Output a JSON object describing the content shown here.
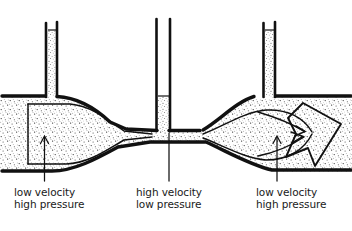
{
  "figure": {
    "type": "hand-drawn physics diagram",
    "background_color": "#ffffff",
    "ink_color": "#111111",
    "fluid_fill": "stipple-texture"
  },
  "annotations": [
    {
      "id": "left",
      "line1": "low velocity",
      "line2": "high pressure",
      "pointer": "up-arrow",
      "x": 14,
      "y": 186
    },
    {
      "id": "middle",
      "line1": "high velocity",
      "line2": "low pressure",
      "pointer": "leader-line",
      "x": 136,
      "y": 186
    },
    {
      "id": "right",
      "line1": "low velocity",
      "line2": "high pressure",
      "pointer": "up-arrow",
      "x": 256,
      "y": 186
    }
  ],
  "manometers": [
    {
      "id": "left-manometer",
      "label": "high pressure column",
      "fill_level": "high"
    },
    {
      "id": "middle-manometer",
      "label": "low pressure column",
      "fill_level": "low"
    },
    {
      "id": "right-manometer",
      "label": "high pressure column",
      "fill_level": "high"
    }
  ],
  "flow": {
    "direction": "left-to-right",
    "outlet_arrow": "large-outline-arrow"
  }
}
